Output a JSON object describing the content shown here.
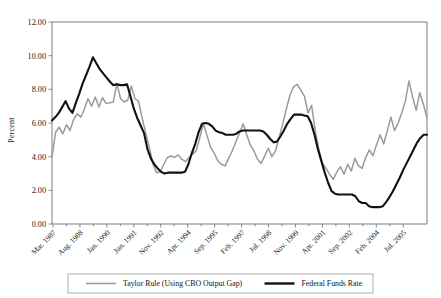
{
  "chart_data": {
    "type": "line",
    "title": "",
    "xlabel": "",
    "ylabel": "Percent",
    "ylim": [
      0,
      12
    ],
    "ytick_labels": [
      "0.00",
      "2.00",
      "4.00",
      "6.00",
      "8.00",
      "10.00",
      "12.00"
    ],
    "ytick_values": [
      0,
      2,
      4,
      6,
      8,
      10,
      12
    ],
    "grid": false,
    "legend_position": "bottom",
    "xtick_labels": [
      "Mar. 1987",
      "Aug. 1988",
      "Jan. 1990",
      "Jun. 1991",
      "Nov. 1992",
      "Apr. 1994",
      "Sep. 1995",
      "Feb. 1997",
      "Jul. 1998",
      "Nov. 1999",
      "Apr. 2001",
      "Sep. 2002",
      "Feb. 2004",
      "Jul. 2005"
    ],
    "x_start_label": "Mar. 1987",
    "x_end_label": "Jul. 2005",
    "colors": {
      "taylor_rule": "#9a9a9a",
      "federal_funds": "#111111"
    },
    "series": [
      {
        "name": "Taylor Rule (Using CBO Output Gap)",
        "color": "#9a9a9a",
        "width": 1.5,
        "values": [
          4.0,
          5.45,
          5.75,
          5.35,
          5.9,
          5.55,
          6.2,
          6.55,
          6.35,
          6.85,
          7.45,
          7.0,
          7.55,
          6.95,
          7.5,
          7.15,
          7.2,
          7.25,
          8.35,
          7.45,
          7.25,
          7.35,
          8.2,
          7.45,
          7.3,
          6.3,
          5.4,
          4.55,
          3.55,
          3.05,
          3.1,
          3.55,
          3.95,
          4.05,
          3.95,
          4.1,
          3.85,
          3.7,
          3.95,
          4.15,
          4.35,
          5.15,
          5.95,
          5.25,
          4.55,
          4.2,
          3.75,
          3.55,
          3.45,
          3.9,
          4.35,
          4.9,
          5.4,
          5.95,
          5.3,
          4.7,
          4.35,
          3.85,
          3.6,
          4.05,
          4.5,
          4.0,
          4.35,
          5.15,
          5.95,
          6.85,
          7.65,
          8.15,
          8.3,
          7.95,
          7.6,
          6.6,
          7.05,
          5.55,
          4.45,
          3.6,
          3.3,
          2.95,
          2.65,
          3.1,
          3.4,
          2.95,
          3.55,
          3.15,
          3.9,
          3.45,
          3.3,
          3.95,
          4.4,
          4.05,
          4.7,
          5.3,
          4.75,
          5.55,
          6.35,
          5.55,
          6.0,
          6.6,
          7.3,
          8.5,
          7.55,
          6.75,
          7.8,
          7.1,
          6.3
        ]
      },
      {
        "name": "Federal Funds Rate",
        "color": "#111111",
        "width": 2.1,
        "values": [
          6.15,
          6.35,
          6.6,
          6.95,
          7.3,
          6.85,
          6.6,
          7.2,
          7.75,
          8.35,
          8.85,
          9.35,
          9.9,
          9.55,
          9.2,
          8.95,
          8.7,
          8.45,
          8.25,
          8.3,
          8.25,
          8.25,
          8.3,
          7.6,
          6.85,
          6.3,
          5.85,
          5.4,
          4.45,
          3.9,
          3.55,
          3.3,
          3.1,
          3.0,
          3.05,
          3.05,
          3.05,
          3.05,
          3.05,
          3.1,
          3.55,
          4.2,
          4.75,
          5.45,
          5.95,
          6.0,
          5.95,
          5.8,
          5.55,
          5.45,
          5.4,
          5.3,
          5.3,
          5.3,
          5.35,
          5.5,
          5.55,
          5.55,
          5.55,
          5.55,
          5.55,
          5.55,
          5.5,
          5.3,
          5.05,
          4.85,
          4.9,
          5.2,
          5.55,
          5.95,
          6.25,
          6.5,
          6.5,
          6.5,
          6.45,
          6.4,
          6.0,
          5.3,
          4.45,
          3.75,
          3.05,
          2.45,
          1.95,
          1.8,
          1.75,
          1.75,
          1.75,
          1.75,
          1.75,
          1.65,
          1.35,
          1.25,
          1.25,
          1.05,
          1.0,
          1.0,
          1.0,
          1.05,
          1.3,
          1.6,
          1.95,
          2.35,
          2.75,
          3.2,
          3.6,
          4.0,
          4.4,
          4.8,
          5.1,
          5.3,
          5.3
        ]
      }
    ],
    "legend_entries": [
      {
        "label": "Taylor Rule (Using CBO Output Gap)",
        "color": "#9a9a9a",
        "width": 1.6
      },
      {
        "label": "Federal Funds Rate",
        "color": "#111111",
        "width": 2.4
      }
    ]
  },
  "axes": {
    "plot_left": 52,
    "plot_right": 427,
    "plot_top": 22,
    "plot_bottom": 224
  }
}
